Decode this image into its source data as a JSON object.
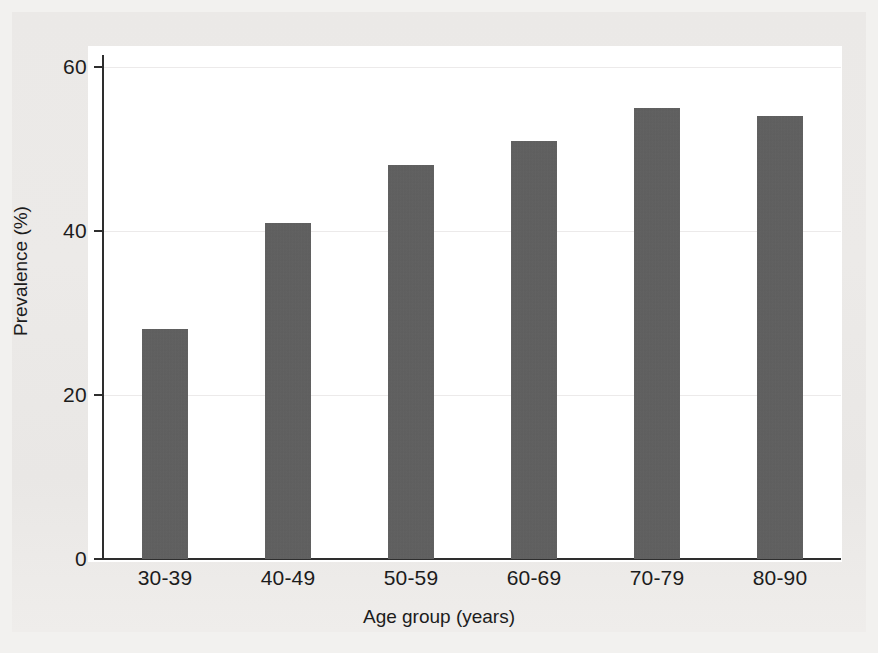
{
  "figure": {
    "background_color": "#edebe9",
    "plot_background_color": "#ffffff",
    "bar_color": "#5e5e5e",
    "axis_color": "#2e2e2e",
    "gridline_color": "#eceaea"
  },
  "chart_data": {
    "type": "bar",
    "title": "",
    "xlabel": "Age group (years)",
    "ylabel": "Prevalence (%)",
    "categories": [
      "30-39",
      "40-49",
      "50-59",
      "60-69",
      "70-79",
      "80-90"
    ],
    "values": [
      28,
      41,
      48,
      51,
      55,
      54
    ],
    "series": [
      {
        "name": "Prevalence",
        "values": [
          28,
          41,
          48,
          51,
          55,
          54
        ]
      }
    ],
    "ylim": [
      0,
      65
    ],
    "yticks": [
      0,
      20,
      40,
      60
    ],
    "ytick_labels": [
      "0",
      "20",
      "40",
      "60"
    ],
    "xtick_labels": [
      "30-39",
      "40-49",
      "50-59",
      "60-69",
      "70-79",
      "80-90"
    ],
    "grid": true,
    "grid_axis": "y",
    "legend": false,
    "legend_position": "none"
  }
}
